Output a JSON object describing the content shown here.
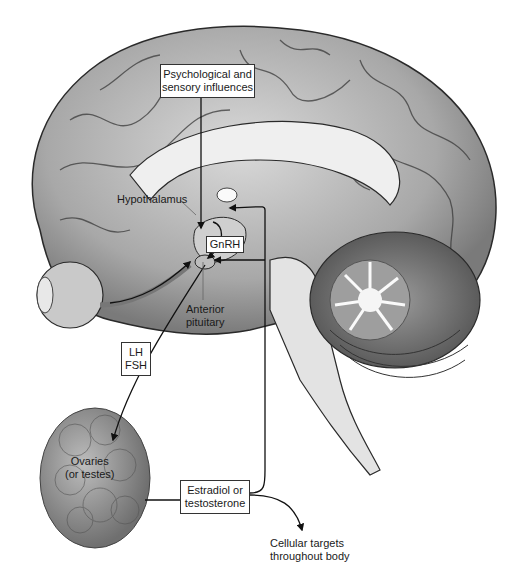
{
  "diagram": {
    "labels": {
      "psych_box_line1": "Psychological and",
      "psych_box_line2": "sensory influences",
      "hypothalamus": "Hypothalamus",
      "gnrh": "GnRH",
      "anterior_line1": "Anterior",
      "anterior_line2": "pituitary",
      "lh": "LH",
      "fsh": "FSH",
      "ovaries_line1": "Ovaries",
      "ovaries_line2": "(or testes)",
      "hormone_line1": "Estradiol or",
      "hormone_line2": "testosterone",
      "targets_line1": "Cellular targets",
      "targets_line2": "throughout body"
    },
    "structures": [
      "cerebrum",
      "corpus callosum",
      "hypothalamus",
      "pituitary",
      "eye",
      "cerebellum",
      "brainstem",
      "gonad"
    ],
    "colors": {
      "brain_gray": "#9a9a9a",
      "brain_light": "#d6d6d6",
      "outline": "#2a2a2a",
      "background": "#ffffff"
    }
  }
}
